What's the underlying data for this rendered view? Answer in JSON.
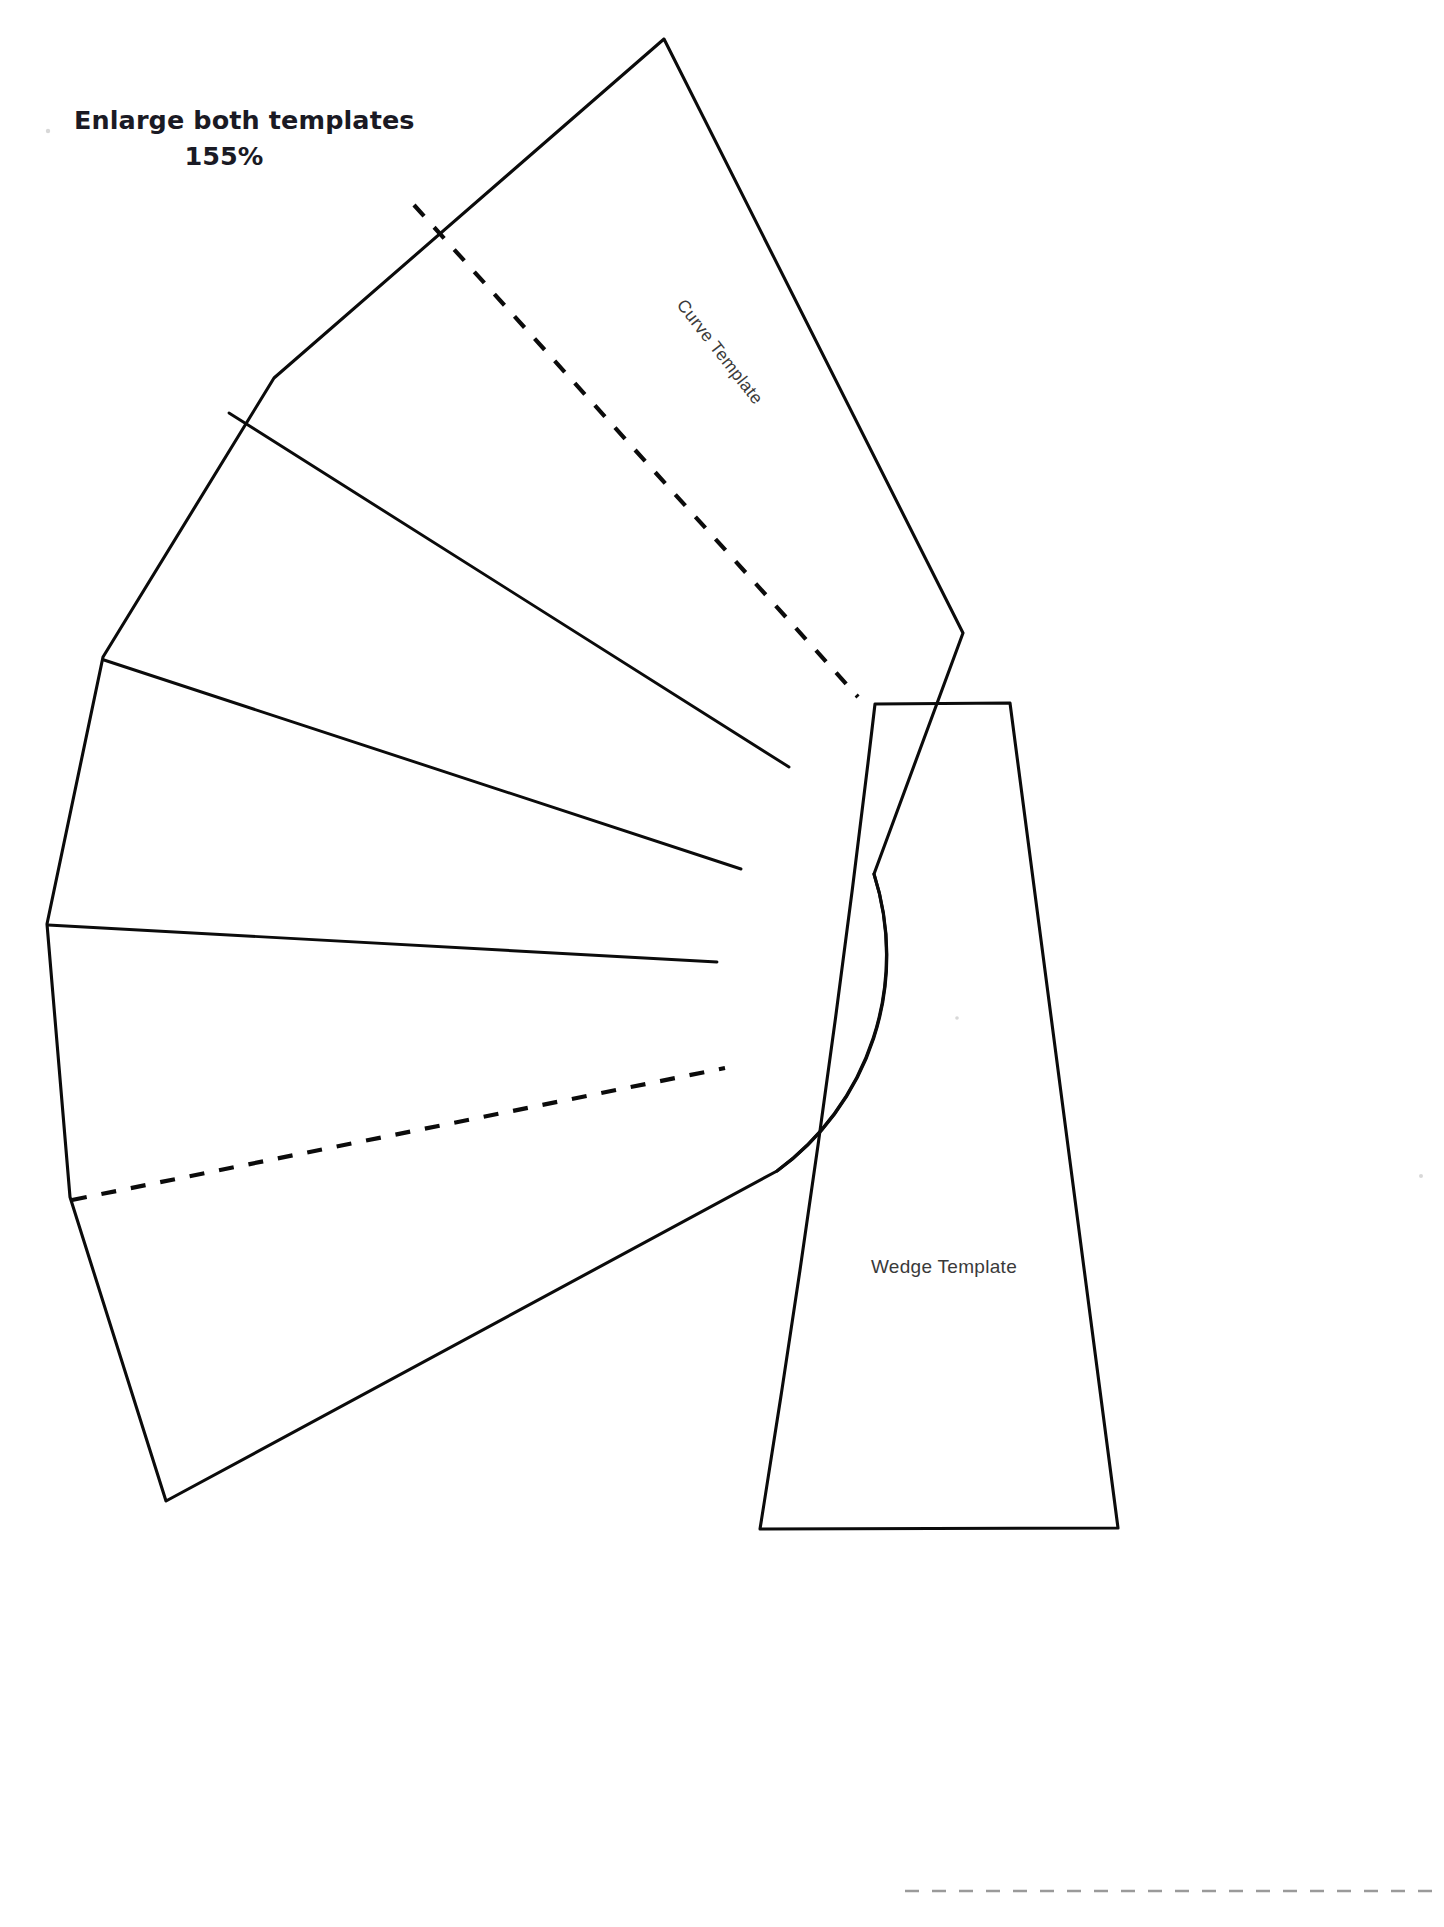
{
  "page": {
    "background_color": "#ffffff",
    "ink_color": "#0b0b0b",
    "label_color": "#3a3a3a",
    "trim_rule_color": "#9a9a9a",
    "width": 1444,
    "height": 1927
  },
  "instructions": {
    "line1": "Enlarge both templates",
    "line2": "155%"
  },
  "templates": {
    "curve": {
      "label": "Curve Template",
      "label_rotation_deg": 52,
      "segment_count": 5,
      "fold_line_count": 2,
      "shape": "annulus-sector-fan"
    },
    "wedge": {
      "label": "Wedge Template",
      "label_rotation_deg": 0,
      "shape": "tapered-trapezoid"
    }
  },
  "trim_rule": {
    "name": "page-trim-guide",
    "style": "dashed",
    "orientation": "horizontal"
  }
}
